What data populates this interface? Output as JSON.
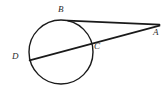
{
  "figure": {
    "kind": "circle-tangent-secant-diagram",
    "width": 168,
    "height": 90,
    "background_color": "#ffffff",
    "stroke_color": "#1a1a1a",
    "label_color": "#2b2b2b"
  },
  "labels": {
    "A": "A",
    "B": "B",
    "C": "C",
    "D": "D"
  },
  "geometry": {
    "circle": {
      "cx": 61,
      "cy": 52,
      "r": 32
    },
    "points": {
      "A": {
        "x": 159,
        "y": 25,
        "role": "external-vertex"
      },
      "B": {
        "x": 68,
        "y": 21,
        "role": "tangent-point"
      },
      "C": {
        "x": 91,
        "y": 41,
        "role": "secant-near-intersection"
      },
      "D": {
        "x": 30,
        "y": 60,
        "role": "secant-far-intersection"
      }
    },
    "segments": [
      {
        "name": "tangent-AB",
        "from": "B",
        "to": "A"
      },
      {
        "name": "secant-AD",
        "from": "A",
        "to": "D"
      }
    ]
  }
}
